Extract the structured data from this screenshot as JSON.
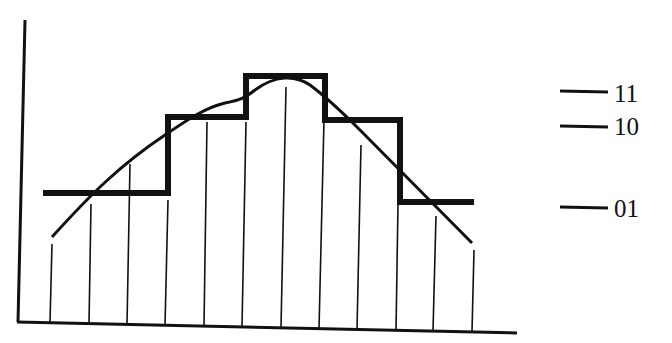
{
  "diagram": {
    "type": "signal-quantization",
    "colors": {
      "ink": "#111111",
      "background": "#ffffff"
    },
    "levels": [
      {
        "code": "11",
        "y": 91
      },
      {
        "code": "10",
        "y": 126
      },
      {
        "code": "01",
        "y": 207
      }
    ],
    "sample_x": [
      51,
      89,
      127,
      165,
      204,
      242,
      281,
      320,
      358,
      397,
      435,
      472
    ],
    "sample_top_y": [
      237,
      204,
      164,
      200,
      122,
      122,
      87,
      90,
      145,
      205,
      216,
      250
    ],
    "quantized_steps": [
      {
        "x0": 43,
        "x1": 168,
        "y": 193
      },
      {
        "x0": 168,
        "x1": 246,
        "y": 117
      },
      {
        "x0": 246,
        "x1": 325,
        "y": 76
      },
      {
        "x0": 325,
        "x1": 400,
        "y": 120
      },
      {
        "x0": 400,
        "x1": 474,
        "y": 202
      }
    ]
  }
}
